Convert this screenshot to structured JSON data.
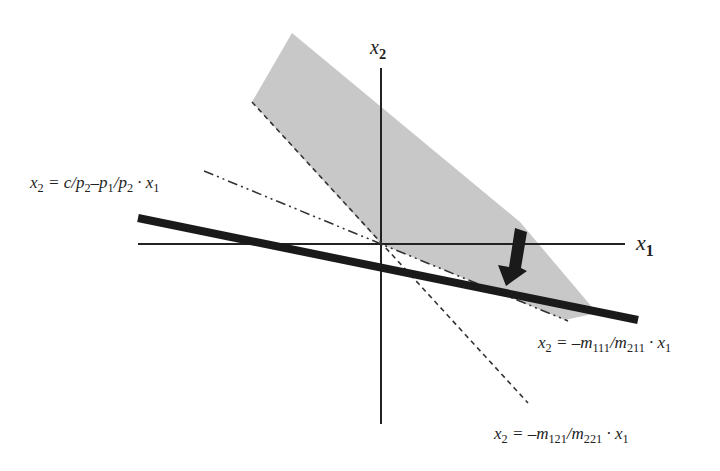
{
  "diagram": {
    "type": "economics-optimization-diagram",
    "axes": {
      "x_label": "x1",
      "y_label": "x2",
      "origin_px": [
        381,
        244
      ]
    },
    "labels": {
      "budget_line": {
        "lhs": "x",
        "lhs_sub": "2",
        "rhs": " = c/p",
        "p2_sub": "2",
        "minus": "–p",
        "p1_sub": "1",
        "slash": "/p",
        "p2b_sub": "2",
        "dot": " · x",
        "x1_sub": "1",
        "full": "x2 = c/p2–p1/p2 · x1"
      },
      "line_m111": {
        "lhs": "x",
        "lhs_sub": "2",
        "eq": " = –m",
        "num_sub": "111",
        "slash": "/m",
        "den_sub": "211",
        "dot": " · x",
        "x1_sub": "1",
        "full": "x2 = –m111/m211 · x1"
      },
      "line_m121": {
        "lhs": "x",
        "lhs_sub": "2",
        "eq": " = –m",
        "num_sub": "121",
        "slash": "/m",
        "den_sub": "221",
        "dot": " · x",
        "x1_sub": "1",
        "full": "x2 = –m121/m221 · x1"
      },
      "axis_x1": {
        "base": "x",
        "sub": "1"
      },
      "axis_x2": {
        "base": "x",
        "sub": "2"
      }
    },
    "elements": [
      {
        "name": "feasible-cone",
        "style": "filled",
        "color": "#c8c8c8"
      },
      {
        "name": "budget-line",
        "style": "thick-solid",
        "color": "#1a1a1a"
      },
      {
        "name": "line-m111",
        "style": "dash-dot",
        "color": "#333333"
      },
      {
        "name": "line-m121",
        "style": "dashed",
        "color": "#333333"
      },
      {
        "name": "shift-arrow",
        "style": "filled-arrow",
        "color": "#1a1a1a",
        "direction": "down"
      }
    ],
    "colors": {
      "shade": "#c8c8c8",
      "ink": "#1a1a1a",
      "background": "#ffffff"
    }
  }
}
